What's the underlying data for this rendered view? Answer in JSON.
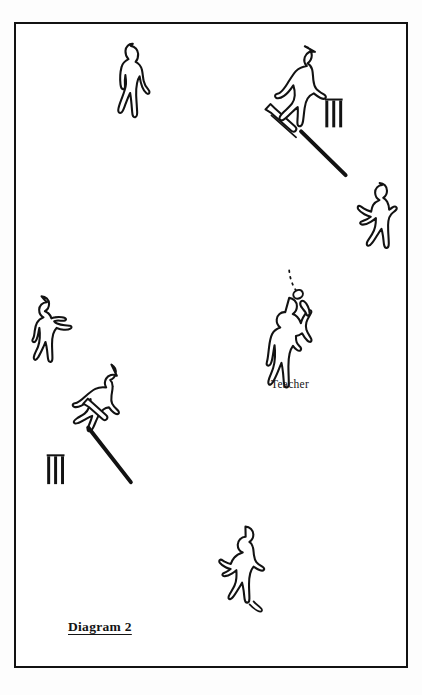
{
  "page": {
    "background_color": "#ffffff",
    "ink_color": "#121212",
    "width": 422,
    "height": 695
  },
  "running_head": {
    "text": "",
    "note": "cropped illegible running head at top edge",
    "color": "#ebebee"
  },
  "frame": {
    "border_color": "#121212",
    "border_width": 2.5,
    "x": 14,
    "y": 22,
    "width": 394,
    "height": 646
  },
  "labels": {
    "teacher": "Teacher",
    "caption": "Diagram 2"
  },
  "diagram": {
    "type": "cricket-practice-field-layout",
    "title": "Diagram 2",
    "figure_count": 7,
    "wicket_count": 2,
    "ball_count": 1,
    "figures": [
      {
        "id": "player-top-left",
        "role": "fielder",
        "x": 128,
        "y": 74,
        "pose": "standing-watching"
      },
      {
        "id": "batsman-top",
        "role": "batsman",
        "x": 292,
        "y": 96,
        "pose": "batting-stroke-forward",
        "holds": "bat"
      },
      {
        "id": "player-right",
        "role": "fielder",
        "x": 378,
        "y": 209,
        "pose": "ready-crouch"
      },
      {
        "id": "teacher",
        "role": "teacher",
        "x": 290,
        "y": 330,
        "pose": "throwing-ball-overhead",
        "label": "Teacher"
      },
      {
        "id": "player-left",
        "role": "fielder",
        "x": 44,
        "y": 320,
        "pose": "ready-crouch"
      },
      {
        "id": "batsman-lower-left",
        "role": "batsman",
        "x": 95,
        "y": 406,
        "pose": "batting-stroke-down",
        "holds": "bat"
      },
      {
        "id": "player-bottom",
        "role": "fielder",
        "x": 238,
        "y": 570,
        "pose": "running"
      }
    ],
    "wickets": [
      {
        "id": "wicket-top-right",
        "x": 334,
        "y": 113,
        "stumps": 3
      },
      {
        "id": "wicket-lower-left",
        "x": 54,
        "y": 470,
        "stumps": 3
      }
    ],
    "ball": {
      "id": "ball",
      "x": 296,
      "y": 289,
      "trajectory": "dotted-arc-upward"
    },
    "lines": [
      {
        "id": "crease-line-top",
        "x1": 288,
        "y1": 127,
        "x2": 347,
        "y2": 168
      },
      {
        "id": "crease-line-lower",
        "x1": 87,
        "y1": 428,
        "x2": 130,
        "y2": 483
      }
    ]
  }
}
